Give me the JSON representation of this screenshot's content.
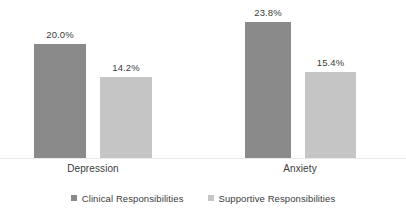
{
  "chart_data": {
    "type": "bar",
    "title": "",
    "subtitle": "",
    "xlabel": "",
    "ylabel": "",
    "grid": false,
    "axis_visible": false,
    "ylim": [
      0,
      28
    ],
    "categories": [
      "Depression",
      "Anxiety"
    ],
    "legend_position": "bottom",
    "series": [
      {
        "name": "Clinical Responsibilities",
        "color": "#8a8a8a",
        "values": [
          20.0,
          23.8
        ],
        "labels": [
          "20.0%",
          "15.4%"
        ]
      },
      {
        "name": "Supportive Responsibilities",
        "color": "#c5c5c5",
        "values": [
          14.2,
          15.4
        ],
        "labels": [
          "14.2%",
          "15.4%"
        ]
      }
    ],
    "bars": [
      {
        "id": "depression-clinical",
        "category": "Depression",
        "series": "Clinical Responsibilities",
        "value": 20.0,
        "label": "20.0%",
        "color": "#8a8a8a",
        "x": 34,
        "width": 52,
        "top": 44
      },
      {
        "id": "depression-supportive",
        "category": "Depression",
        "series": "Supportive Responsibilities",
        "value": 14.2,
        "label": "14.2%",
        "color": "#c5c5c5",
        "x": 100,
        "width": 52,
        "top": 77
      },
      {
        "id": "anxiety-clinical",
        "category": "Anxiety",
        "series": "Clinical Responsibilities",
        "value": 23.8,
        "label": "23.8%",
        "color": "#8a8a8a",
        "x": 245,
        "width": 46,
        "top": 22
      },
      {
        "id": "anxiety-supportive",
        "category": "Anxiety",
        "series": "Supportive Responsibilities",
        "value": 15.4,
        "label": "15.4%",
        "color": "#c5c5c5",
        "x": 305,
        "width": 51,
        "top": 72
      }
    ],
    "category_label_positions": [
      {
        "label": "Depression",
        "center": 93
      },
      {
        "label": "Anxiety",
        "center": 300
      }
    ]
  },
  "legend": {
    "items": [
      {
        "label": "Clinical Responsibilities",
        "color": "#8a8a8a"
      },
      {
        "label": "Supportive Responsibilities",
        "color": "#c5c5c5"
      }
    ]
  },
  "colors": {
    "series_clinical": "#8a8a8a",
    "series_supportive": "#c5c5c5",
    "text": "#3b3b3b",
    "baseline": "#e9e9e9",
    "background": "#ffffff"
  }
}
